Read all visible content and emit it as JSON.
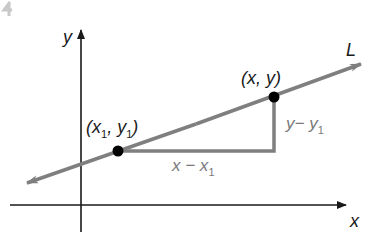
{
  "diagram": {
    "axes": {
      "x_label": "x",
      "y_label": "y"
    },
    "line": {
      "label": "L"
    },
    "points": [
      {
        "label_main": "(x",
        "label_sub": "1",
        "label_mid": ", y",
        "label_sub2": "1",
        "label_end": ")"
      },
      {
        "label": "(x, y)"
      }
    ],
    "triangle": {
      "horizontal_label_main": "x − x",
      "horizontal_label_sub": "1",
      "vertical_label_main": "y− y",
      "vertical_label_sub": "1"
    },
    "colors": {
      "axis": "#1a1a1a",
      "line": "#7f7f7f",
      "triangle": "#7f7f7f",
      "point": "#000000",
      "label_gray": "#7a7a7a"
    }
  }
}
